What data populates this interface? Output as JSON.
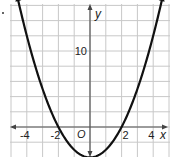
{
  "chart_data": {
    "type": "line",
    "title": "",
    "function": "y = x^2 - 4",
    "xlabel": "x",
    "ylabel": "y",
    "origin_label": "O",
    "x_tick_labels": [
      "-4",
      "-2",
      "2",
      "4"
    ],
    "x_tick_values": [
      -4,
      -2,
      2,
      4
    ],
    "y_tick_labels": [
      "10"
    ],
    "y_tick_values": [
      10
    ],
    "xlim": [
      -5.1,
      5.0
    ],
    "ylim": [
      -4.1,
      16.6
    ],
    "grid": true,
    "grid_x_step": 1,
    "grid_y_step": 2,
    "series": [
      {
        "name": "parabola",
        "x": [
          -4.6,
          -4,
          -3,
          -2,
          -1,
          0,
          1,
          2,
          3,
          4,
          4.6
        ],
        "y": [
          17.16,
          12,
          5,
          0,
          -3,
          -4,
          -3,
          0,
          5,
          12,
          17.16
        ]
      }
    ],
    "colors": {
      "grid": "#c8c8c8",
      "axis": "#555555",
      "curve": "#111111",
      "background": "#ffffff"
    }
  }
}
